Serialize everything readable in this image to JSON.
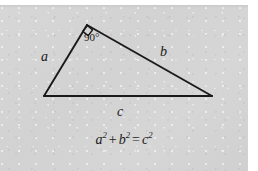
{
  "figure": {
    "name": "pythagorean-theorem-right-triangle",
    "background_color": "#d4d4d4",
    "stroke_color": "#1a1a1a",
    "page_color": "#ffffff"
  },
  "diagram": {
    "type": "right-triangle",
    "vertices": {
      "top": [
        87,
        25
      ],
      "left": [
        44,
        96
      ],
      "right": [
        212,
        96
      ]
    },
    "right_angle_marker": {
      "at_vertex": "top",
      "size": 9
    },
    "sides": [
      {
        "name": "a",
        "label": "a",
        "from": "left",
        "to": "top"
      },
      {
        "name": "b",
        "label": "b",
        "from": "top",
        "to": "right"
      },
      {
        "name": "c",
        "label": "c",
        "from": "left",
        "to": "right"
      }
    ]
  },
  "labels": {
    "side_a": "a",
    "side_b": "b",
    "side_c": "c",
    "angle": "90°"
  },
  "equation": {
    "a": "a",
    "a_exp": "2",
    "plus": "+",
    "b": "b",
    "b_exp": "2",
    "equals": "=",
    "c": "c",
    "c_exp": "2",
    "plain": "a² + b² = c²"
  }
}
